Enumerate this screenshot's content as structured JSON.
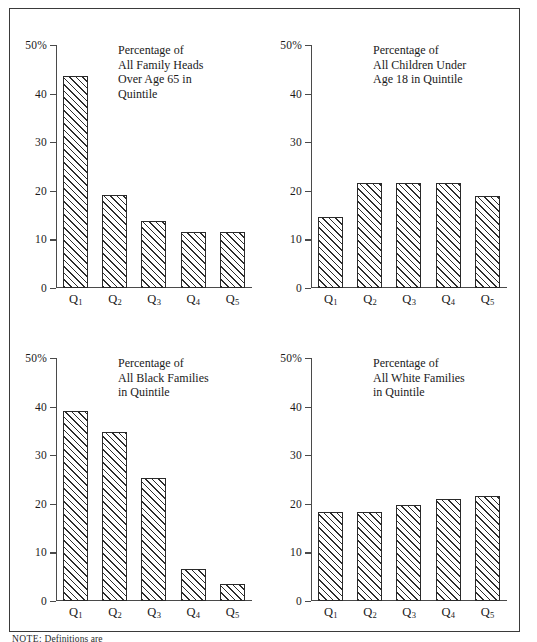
{
  "figure": {
    "note_label": "NOTE:",
    "note_text": "Definitions are"
  },
  "axis": {
    "y_tick_labels": [
      "50%",
      "40",
      "30",
      "20",
      "10",
      "0"
    ],
    "y_tick_values": [
      50,
      40,
      30,
      20,
      10,
      0
    ],
    "x_tick_labels": [
      "Q1",
      "Q2",
      "Q3",
      "Q4",
      "Q5"
    ]
  },
  "panels": [
    {
      "id": "family-heads-over-65",
      "title": "Percentage of\nAll Family Heads\nOver Age 65 in\nQuintile",
      "values": [
        43.6,
        19.2,
        13.7,
        11.6,
        11.6
      ]
    },
    {
      "id": "children-under-18",
      "title": "Percentage of\nAll Children Under\nAge 18 in Quintile",
      "values": [
        14.7,
        21.7,
        21.7,
        21.7,
        18.9
      ]
    },
    {
      "id": "black-families",
      "title": "Percentage of\nAll Black Families\nin Quintile",
      "values": [
        39.0,
        34.7,
        25.3,
        6.5,
        3.4
      ]
    },
    {
      "id": "white-families",
      "title": "Percentage of\nAll White Families\nin Quintile",
      "values": [
        18.3,
        18.3,
        19.8,
        21.0,
        21.7
      ]
    }
  ],
  "chart_data": {
    "type": "bar",
    "xlabel": "",
    "ylabel": "",
    "ylim": [
      0,
      50
    ],
    "yticks": [
      0,
      10,
      20,
      30,
      40,
      50
    ],
    "ytick_labels": [
      "0",
      "10",
      "20",
      "30",
      "40",
      "50%"
    ],
    "grid": false,
    "legend": "none",
    "categories": [
      "Q1",
      "Q2",
      "Q3",
      "Q4",
      "Q5"
    ],
    "panels": [
      {
        "panel": "top-left",
        "title": "Percentage of All Family Heads Over Age 65 in Quintile",
        "categories": [
          "Q1",
          "Q2",
          "Q3",
          "Q4",
          "Q5"
        ],
        "values": [
          43.6,
          19.2,
          13.7,
          11.6,
          11.6
        ]
      },
      {
        "panel": "top-right",
        "title": "Percentage of All Children Under Age 18 in Quintile",
        "categories": [
          "Q1",
          "Q2",
          "Q3",
          "Q4",
          "Q5"
        ],
        "values": [
          14.7,
          21.7,
          21.7,
          21.7,
          18.9
        ]
      },
      {
        "panel": "bottom-left",
        "title": "Percentage of All Black Families in Quintile",
        "categories": [
          "Q1",
          "Q2",
          "Q3",
          "Q4",
          "Q5"
        ],
        "values": [
          39.0,
          34.7,
          25.3,
          6.5,
          3.4
        ]
      },
      {
        "panel": "bottom-right",
        "title": "Percentage of All White Families in Quintile",
        "categories": [
          "Q1",
          "Q2",
          "Q3",
          "Q4",
          "Q5"
        ],
        "values": [
          18.3,
          18.3,
          19.8,
          21.0,
          21.7
        ]
      }
    ]
  },
  "colors": {
    "frame": "#3a3a3a",
    "axis": "#4a4a4a",
    "bar_outline": "#2a2a2a",
    "hatch": "#2d2d2d",
    "background": "#ffffff",
    "text": "#1a1a1a"
  }
}
